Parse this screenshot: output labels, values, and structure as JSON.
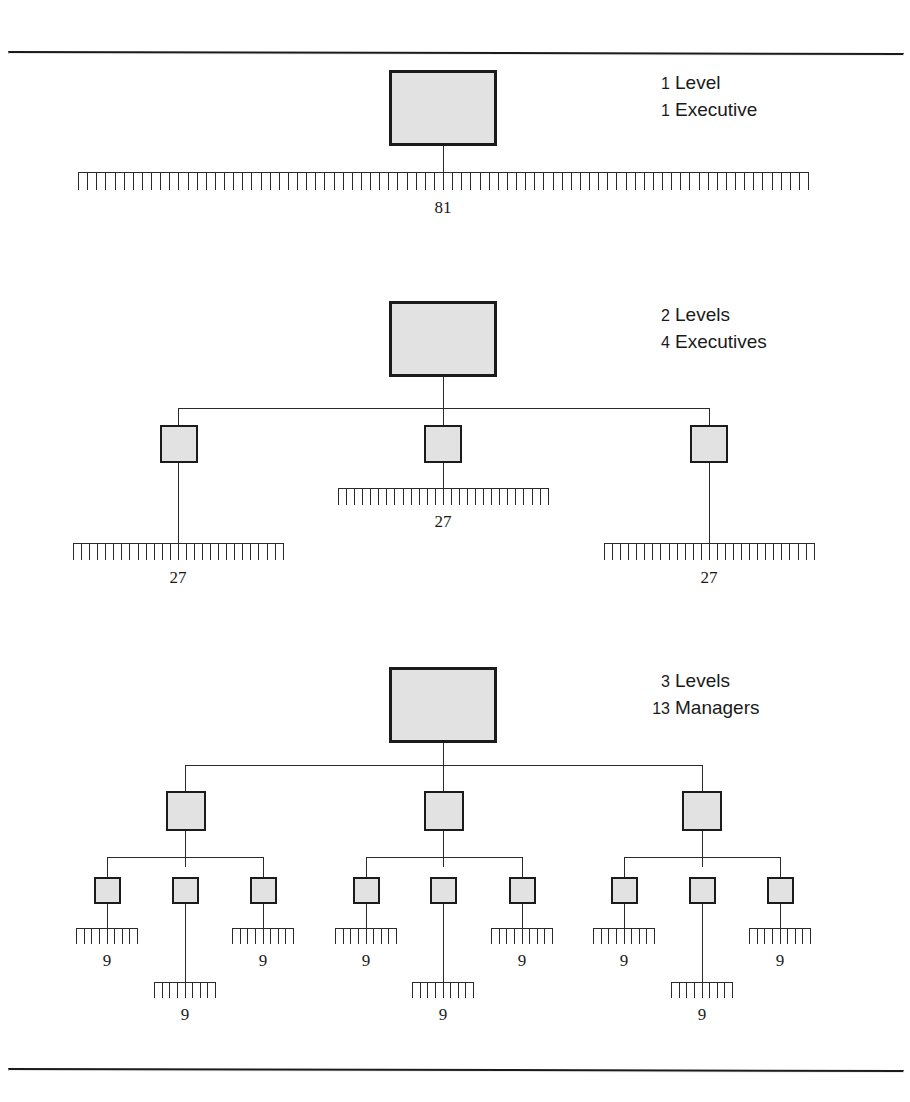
{
  "figure": {
    "type": "org-hierarchy-span-of-control",
    "panels": [
      {
        "id": "panel-1",
        "legend": {
          "levels_text": "1 Level",
          "levels_num": "1",
          "levels_word": "Level",
          "roles_num": "1",
          "roles_word": "Executive",
          "roles_text": "1 Executive"
        },
        "top_box": {
          "label": ""
        },
        "rakes": [
          {
            "teeth": 81,
            "count_label": "81"
          }
        ],
        "total_workers": 81,
        "management_levels": 1,
        "managers": 1
      },
      {
        "id": "panel-2",
        "legend": {
          "levels_text": "2 Levels",
          "levels_num": "2",
          "levels_word": "Levels",
          "roles_num": "4",
          "roles_word": "Executives",
          "roles_text": "4 Executives"
        },
        "top_box": {
          "label": ""
        },
        "mid_boxes": [
          {
            "label": ""
          },
          {
            "label": ""
          },
          {
            "label": ""
          }
        ],
        "rakes": [
          {
            "teeth": 27,
            "count_label": "27"
          },
          {
            "teeth": 27,
            "count_label": "27"
          },
          {
            "teeth": 27,
            "count_label": "27"
          }
        ],
        "total_workers": 81,
        "management_levels": 2,
        "managers": 4
      },
      {
        "id": "panel-3",
        "legend": {
          "levels_text": "3 Levels",
          "levels_num": "3",
          "levels_word": "Levels",
          "roles_num": "13",
          "roles_word": "Managers",
          "roles_text": "13 Managers"
        },
        "top_box": {
          "label": ""
        },
        "mid_boxes": [
          {
            "label": ""
          },
          {
            "label": ""
          },
          {
            "label": ""
          }
        ],
        "leaf_boxes": [
          {
            "label": ""
          },
          {
            "label": ""
          },
          {
            "label": ""
          },
          {
            "label": ""
          },
          {
            "label": ""
          },
          {
            "label": ""
          },
          {
            "label": ""
          },
          {
            "label": ""
          },
          {
            "label": ""
          }
        ],
        "rakes": [
          {
            "teeth": 9,
            "count_label": "9"
          },
          {
            "teeth": 9,
            "count_label": "9"
          },
          {
            "teeth": 9,
            "count_label": "9"
          },
          {
            "teeth": 9,
            "count_label": "9"
          },
          {
            "teeth": 9,
            "count_label": "9"
          },
          {
            "teeth": 9,
            "count_label": "9"
          },
          {
            "teeth": 9,
            "count_label": "9"
          },
          {
            "teeth": 9,
            "count_label": "9"
          },
          {
            "teeth": 9,
            "count_label": "9"
          }
        ],
        "total_workers": 81,
        "management_levels": 3,
        "managers": 13
      }
    ],
    "colors": {
      "box_fill": "#e2e2e2",
      "box_stroke": "#1b1b1b",
      "line": "#2a2a2a",
      "rule": "#1b1b1b",
      "text": "#1a1a1a",
      "background": "#ffffff"
    }
  }
}
